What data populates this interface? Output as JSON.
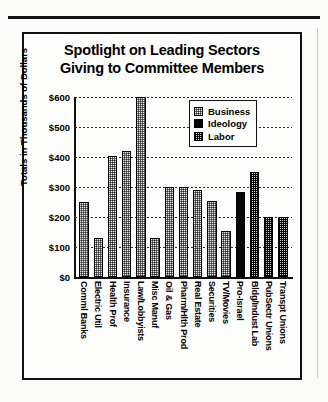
{
  "chart_data": {
    "type": "bar",
    "title": "Spotlight on Leading Sectors Giving to Committee Members",
    "title_lines": [
      "Spotlight on Leading Sectors",
      "Giving to Committee Members"
    ],
    "xlabel": "",
    "ylabel": "Totals in Thousands of Dollars",
    "ylim": [
      0,
      600
    ],
    "ytick_values": [
      600,
      500,
      400,
      300,
      200,
      100,
      0
    ],
    "ytick_labels": [
      "$600",
      "$500",
      "$400",
      "$300",
      "$200",
      "$100",
      "$0"
    ],
    "grid": true,
    "legend_position": "upper right",
    "legend": [
      {
        "name": "Business",
        "pattern": "light-checker",
        "color": "#e9e9e9"
      },
      {
        "name": "Ideology",
        "pattern": "solid-black",
        "color": "#080808"
      },
      {
        "name": "Labor",
        "pattern": "dark-checker",
        "color": "#cfcfcf"
      }
    ],
    "categories": [
      "Comml Banks",
      "Electric Util",
      "Health Prof",
      "Insurance",
      "Law/Lobbyists",
      "Misc Manuf",
      "Oil & Gas",
      "Pharm/Hlth Prod",
      "Real Estate",
      "Securities",
      "TV/Movies",
      "Pro-Israel",
      "Bldg/Indust Lab",
      "PubSectr Unions",
      "Transpt Unions"
    ],
    "values": [
      250,
      130,
      405,
      420,
      600,
      130,
      300,
      300,
      290,
      255,
      155,
      285,
      350,
      200,
      200
    ],
    "groups": [
      "Business",
      "Business",
      "Business",
      "Business",
      "Business",
      "Business",
      "Business",
      "Business",
      "Business",
      "Business",
      "Business",
      "Ideology",
      "Labor",
      "Labor",
      "Labor"
    ]
  }
}
